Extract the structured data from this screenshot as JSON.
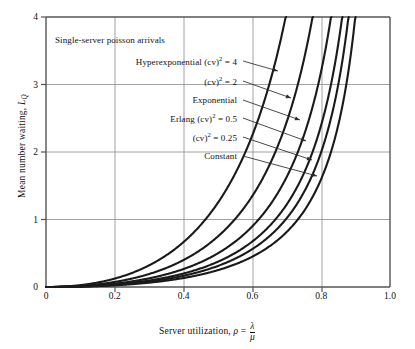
{
  "figure": {
    "note": "Single-server poisson arrivals",
    "background": "#ffffff",
    "line_color": "#1a1a1a",
    "grid_color": "#8c8c8c",
    "axis_color": "#555555"
  },
  "axes": {
    "x": {
      "title_prefix": "Server utilization, ",
      "title_symbol": "ρ",
      "title_equals": " = ",
      "title_numerator": "λ",
      "title_denominator": "μ",
      "title_plain": "Server utilization, ρ = λ/μ",
      "ticks": [
        "0",
        "0.2",
        "0.4",
        "0.6",
        "0.8",
        "1.0"
      ],
      "tick_values": [
        0,
        0.2,
        0.4,
        0.6,
        0.8,
        1.0
      ],
      "min": 0,
      "max": 1.0
    },
    "y": {
      "title_prefix": "Mean number waiting, ",
      "title_symbol": "L",
      "title_sub": "Q",
      "title_plain": "Mean number waiting, L_Q",
      "ticks": [
        "0",
        "1",
        "2",
        "3",
        "4"
      ],
      "tick_values": [
        0,
        1,
        2,
        3,
        4
      ],
      "min": 0,
      "max": 4
    }
  },
  "annotations": [
    {
      "id": "note",
      "label": "Single-server poisson arrivals",
      "text_x": 55,
      "text_y": 40,
      "align": "left",
      "has_arrow": false
    },
    {
      "id": "hyperexponential-4",
      "label_main": "Hyperexponential (cv)",
      "label_sup": "2",
      "label_tail": " = 4",
      "label": "Hyperexponential (cv)² = 4",
      "text_x": 237,
      "text_y": 61,
      "align": "right",
      "has_arrow": true,
      "arrow_from_x": 243,
      "arrow_from_y": 61,
      "arrow_to_x": 278,
      "arrow_to_y": 71
    },
    {
      "id": "cv-2",
      "label_main": "(cv)",
      "label_sup": "2",
      "label_tail": " = 2",
      "label": "(cv)² = 2",
      "text_x": 237,
      "text_y": 81,
      "align": "right",
      "has_arrow": true,
      "arrow_from_x": 243,
      "arrow_from_y": 81,
      "arrow_to_x": 291,
      "arrow_to_y": 98
    },
    {
      "id": "exponential",
      "label_main": "Exponential",
      "label_sup": "",
      "label_tail": "",
      "label": "Exponential",
      "text_x": 237,
      "text_y": 100,
      "align": "right",
      "has_arrow": true,
      "arrow_from_x": 243,
      "arrow_from_y": 100,
      "arrow_to_x": 300,
      "arrow_to_y": 120
    },
    {
      "id": "erlang-0.5",
      "label_main": "Erlang (cv)",
      "label_sup": "2",
      "label_tail": " = 0.5",
      "label": "Erlang (cv)² = 0.5",
      "text_x": 237,
      "text_y": 118,
      "align": "right",
      "has_arrow": true,
      "arrow_from_x": 243,
      "arrow_from_y": 118,
      "arrow_to_x": 306,
      "arrow_to_y": 141
    },
    {
      "id": "cv-0.25",
      "label_main": "(cv)",
      "label_sup": "2",
      "label_tail": " = 0.25",
      "label": "(cv)² = 0.25",
      "text_x": 237,
      "text_y": 137,
      "align": "right",
      "has_arrow": true,
      "arrow_from_x": 243,
      "arrow_from_y": 137,
      "arrow_to_x": 312,
      "arrow_to_y": 160
    },
    {
      "id": "constant",
      "label_main": "Constant",
      "label_sup": "",
      "label_tail": "",
      "label": "Constant",
      "text_x": 237,
      "text_y": 156,
      "align": "right",
      "has_arrow": true,
      "arrow_from_x": 243,
      "arrow_from_y": 156,
      "arrow_to_x": 317,
      "arrow_to_y": 176
    }
  ],
  "chart_data": {
    "type": "line",
    "title": "",
    "subtitle": "Single-server poisson arrivals",
    "xlabel": "Server utilization, ρ = λ/μ",
    "ylabel": "Mean number waiting, L_Q",
    "xlim": [
      0,
      1.0
    ],
    "ylim": [
      0,
      4
    ],
    "xticks": [
      0,
      0.2,
      0.4,
      0.6,
      0.8,
      1.0
    ],
    "yticks": [
      0,
      1,
      2,
      3,
      4
    ],
    "grid": true,
    "legend": "inline-annotations",
    "formula": "L_Q = rho^2 * (1 + cv^2) / (2 * (1 - rho))",
    "x": [
      0.0,
      0.05,
      0.1,
      0.15,
      0.2,
      0.25,
      0.3,
      0.35,
      0.4,
      0.45,
      0.5,
      0.55,
      0.6,
      0.65,
      0.7,
      0.75,
      0.8,
      0.85,
      0.9
    ],
    "series": [
      {
        "name": "Hyperexponential (cv)² = 4",
        "cv2": 4,
        "values": [
          0.0,
          0.0066,
          0.0278,
          0.0662,
          0.125,
          0.2083,
          0.3214,
          0.4712,
          0.6667,
          0.9205,
          1.25,
          1.6806,
          2.25,
          3.0179,
          4.0833,
          5.625,
          8.0,
          12.042,
          20.25
        ],
        "top_crossing_x": 0.633
      },
      {
        "name": "(cv)² = 2",
        "cv2": 2,
        "values": [
          0.0,
          0.0039,
          0.0167,
          0.0397,
          0.075,
          0.125,
          0.1929,
          0.2827,
          0.4,
          0.5523,
          0.75,
          1.0083,
          1.35,
          1.8107,
          2.45,
          3.375,
          4.8,
          7.225,
          12.15
        ],
        "top_crossing_x": 0.738
      },
      {
        "name": "Exponential",
        "cv2": 1,
        "values": [
          0.0,
          0.0026,
          0.0111,
          0.0265,
          0.05,
          0.0833,
          0.1286,
          0.1885,
          0.2667,
          0.3682,
          0.5,
          0.6722,
          0.9,
          1.2071,
          1.6333,
          2.25,
          3.2,
          4.8167,
          8.1
        ],
        "top_crossing_x": 0.8
      },
      {
        "name": "Erlang (cv)² = 0.5",
        "cv2": 0.5,
        "values": [
          0.0,
          0.002,
          0.0083,
          0.0199,
          0.0375,
          0.0625,
          0.0964,
          0.1413,
          0.2,
          0.2761,
          0.375,
          0.5042,
          0.675,
          0.9054,
          1.225,
          1.6875,
          2.4,
          3.6125,
          6.075
        ],
        "top_crossing_x": 0.832
      },
      {
        "name": "(cv)² = 0.25",
        "cv2": 0.25,
        "values": [
          0.0,
          0.0016,
          0.0069,
          0.0166,
          0.0313,
          0.0521,
          0.0804,
          0.1178,
          0.1667,
          0.2301,
          0.3125,
          0.4201,
          0.5625,
          0.7545,
          1.0208,
          1.4063,
          2.0,
          3.0104,
          5.0625
        ],
        "top_crossing_x": 0.855
      },
      {
        "name": "Constant",
        "cv2": 0,
        "values": [
          0.0,
          0.0013,
          0.0056,
          0.0132,
          0.025,
          0.0417,
          0.0643,
          0.0942,
          0.1333,
          0.1841,
          0.25,
          0.3361,
          0.45,
          0.6036,
          0.8167,
          1.125,
          1.6,
          2.4083,
          4.05
        ],
        "top_crossing_x": 0.878
      }
    ]
  }
}
